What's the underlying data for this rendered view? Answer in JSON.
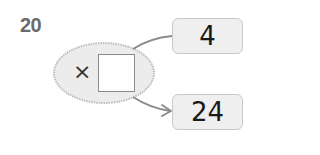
{
  "problem": {
    "number": "20"
  },
  "operator": {
    "symbol": "×",
    "blank": ""
  },
  "boxes": [
    {
      "value": "4"
    },
    {
      "value": "24"
    }
  ],
  "colors": {
    "ellipse_fill": "#ececec",
    "ellipse_border": "#bdbdbd",
    "box_fill": "#efefef",
    "box_border": "#c9c9c9",
    "arrow": "#8c8c8c",
    "number": "#6b6b6b"
  }
}
